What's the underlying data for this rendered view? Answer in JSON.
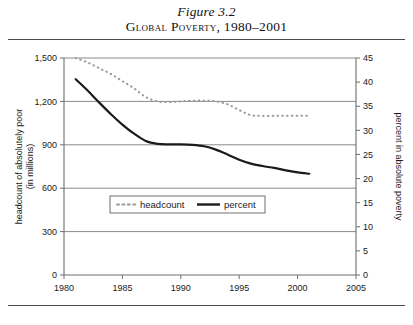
{
  "figure": {
    "number_label": "Figure 3.2",
    "title": "Global Poverty, 1980–2001"
  },
  "chart_data": {
    "type": "line",
    "title": "Global Poverty, 1980–2001",
    "xlabel": "year",
    "ylabel": "headcount of absolutely poor (in millions)",
    "y2label": "percent in absolute poverty",
    "xlim": [
      1980,
      2005
    ],
    "ylim": [
      0,
      1500
    ],
    "y2lim": [
      0,
      45
    ],
    "xticks": [
      1980,
      1985,
      1990,
      1995,
      2000,
      2005
    ],
    "xtick_labels": [
      "1980",
      "1985",
      "1990",
      "1995",
      "2000",
      "2005"
    ],
    "yticks": [
      0,
      300,
      600,
      900,
      1200,
      1500
    ],
    "ytick_labels": [
      "0",
      "300",
      "600",
      "900",
      "1,200",
      "1,500"
    ],
    "y2ticks": [
      0,
      5,
      10,
      15,
      20,
      25,
      30,
      35,
      40,
      45
    ],
    "y2tick_labels": [
      "0",
      "5",
      "10",
      "15",
      "20",
      "25",
      "30",
      "35",
      "40",
      "45"
    ],
    "grid": "horizontal",
    "legend_position": "center-lower",
    "series": [
      {
        "name": "headcount",
        "axis": "left",
        "style": "dotted",
        "color": "#9a9a9a",
        "x": [
          1981,
          1982,
          1983,
          1984,
          1985,
          1986,
          1987,
          1988,
          1989,
          1990,
          1991,
          1992,
          1993,
          1994,
          1995,
          1996,
          1997,
          1998,
          1999,
          2000,
          2001
        ],
        "values": [
          1500,
          1470,
          1430,
          1390,
          1340,
          1290,
          1230,
          1200,
          1195,
          1200,
          1205,
          1205,
          1200,
          1180,
          1140,
          1105,
          1100,
          1100,
          1100,
          1100,
          1100
        ]
      },
      {
        "name": "percent",
        "axis": "right",
        "style": "solid",
        "color": "#1a1a1a",
        "x": [
          1981,
          1982,
          1983,
          1984,
          1985,
          1986,
          1987,
          1988,
          1989,
          1990,
          1991,
          1992,
          1993,
          1994,
          1995,
          1996,
          1997,
          1998,
          1999,
          2000,
          2001
        ],
        "values": [
          40.6,
          38.3,
          35.8,
          33.4,
          31.2,
          29.3,
          27.8,
          27.2,
          27.1,
          27.1,
          27.0,
          26.7,
          26.0,
          25.0,
          23.9,
          23.1,
          22.6,
          22.2,
          21.7,
          21.3,
          21.0
        ]
      }
    ]
  },
  "legend": {
    "items": [
      {
        "label": "headcount",
        "marker": "dotted-gray"
      },
      {
        "label": "percent",
        "marker": "solid-black"
      }
    ]
  },
  "axes": {
    "left_title_line1": "headcount of absolutely poor",
    "left_title_line2": "(in millions)",
    "right_title": "percent in absolute poverty",
    "x_title": "year"
  }
}
